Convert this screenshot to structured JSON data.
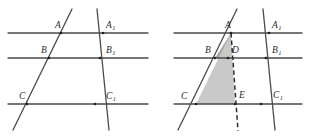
{
  "figure": {
    "background_color": "#ffffff",
    "line_color": "#4a4a4a",
    "dashed_line_color": "#2e2e2e",
    "shade_color": "#c9c9c9",
    "shade_color_dark": "#a8a8a8",
    "label_color": "#2b2b2b"
  },
  "left_diagram": {
    "name": "parallel-lines-with-two-transversals",
    "horizontal_lines": [
      {
        "id": "line-a",
        "y": 33,
        "x1": 8,
        "x2": 148
      },
      {
        "id": "line-b",
        "y": 58,
        "x1": 8,
        "x2": 148
      },
      {
        "id": "line-c",
        "y": 104,
        "x1": 8,
        "x2": 148
      }
    ],
    "transversals": [
      {
        "id": "transversal-left",
        "x1": 13,
        "y1": 130,
        "x2": 72,
        "y2": 9
      },
      {
        "id": "transversal-right",
        "x1": 109,
        "y1": 130,
        "x2": 97,
        "y2": 9
      }
    ],
    "points": [
      {
        "id": "A",
        "label": "A",
        "sub": "",
        "px": 61,
        "py": 33,
        "lx": 55,
        "ly": 28
      },
      {
        "id": "A1",
        "label": "A",
        "sub": "1",
        "px": 103,
        "py": 33,
        "lx": 106,
        "ly": 28
      },
      {
        "id": "B",
        "label": "B",
        "sub": "",
        "px": 49,
        "py": 58,
        "lx": 41,
        "ly": 53
      },
      {
        "id": "B1",
        "label": "B",
        "sub": "1",
        "px": 100,
        "py": 58,
        "lx": 106,
        "ly": 53
      },
      {
        "id": "C",
        "label": "C",
        "sub": "",
        "px": 27,
        "py": 104,
        "lx": 19,
        "ly": 99
      },
      {
        "id": "C1",
        "label": "C",
        "sub": "1",
        "px": 95,
        "py": 104,
        "lx": 106,
        "ly": 99
      }
    ]
  },
  "right_diagram": {
    "name": "parallel-lines-with-shaded-triangle",
    "horizontal_lines": [
      {
        "id": "line-a",
        "y": 33,
        "x1": 174,
        "x2": 302
      },
      {
        "id": "line-b",
        "y": 58,
        "x1": 174,
        "x2": 302
      },
      {
        "id": "line-c",
        "y": 104,
        "x1": 174,
        "x2": 302
      }
    ],
    "transversals": [
      {
        "id": "transversal-left",
        "x1": 178,
        "y1": 130,
        "x2": 237,
        "y2": 9
      },
      {
        "id": "transversal-right",
        "x1": 275,
        "y1": 130,
        "x2": 263,
        "y2": 9
      }
    ],
    "dashed_segment": {
      "id": "segment-A-E-extended",
      "x1": 231,
      "y1": 33,
      "x2": 238,
      "y2": 131
    },
    "shaded_regions": [
      {
        "id": "triangle-A-B-D",
        "points": "231,33 215,58 228,58",
        "fill": "#a8a8a8"
      },
      {
        "id": "triangle-A-C-E",
        "points": "231,33 196,104 235,104",
        "fill": "#c9c9c9"
      }
    ],
    "points": [
      {
        "id": "A",
        "label": "A",
        "sub": "",
        "px": 231,
        "py": 33,
        "lx": 225,
        "ly": 28
      },
      {
        "id": "A1",
        "label": "A",
        "sub": "1",
        "px": 269,
        "py": 33,
        "lx": 272,
        "ly": 28
      },
      {
        "id": "B",
        "label": "B",
        "sub": "",
        "px": 215,
        "py": 58,
        "lx": 205,
        "ly": 53
      },
      {
        "id": "D",
        "label": "D",
        "sub": "",
        "px": 228,
        "py": 58,
        "lx": 232,
        "ly": 53
      },
      {
        "id": "B1",
        "label": "B",
        "sub": "1",
        "px": 266,
        "py": 58,
        "lx": 272,
        "ly": 53
      },
      {
        "id": "C",
        "label": "C",
        "sub": "",
        "px": 196,
        "py": 104,
        "lx": 181,
        "ly": 99
      },
      {
        "id": "E",
        "label": "E",
        "sub": "",
        "px": 235,
        "py": 104,
        "lx": 239,
        "ly": 98
      },
      {
        "id": "C1",
        "label": "C",
        "sub": "1",
        "px": 261,
        "py": 104,
        "lx": 273,
        "ly": 98
      }
    ]
  }
}
